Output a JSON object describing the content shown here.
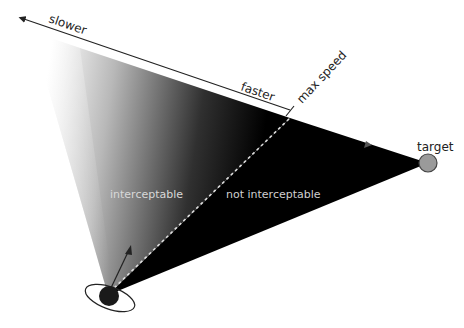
{
  "diagram": {
    "labels": {
      "slower": "slower",
      "faster": "faster",
      "max_speed": "max speed",
      "target": "target",
      "interceptable": "interceptable",
      "not_interceptable": "not interceptable"
    },
    "colors": {
      "background": "#ffffff",
      "fan_dark": "#000000",
      "fan_light": "#ffffff",
      "agent": "#1a1a1a",
      "target": "#9a9a9a",
      "speed_axis": "#222222",
      "dashed_line": "#dddddd",
      "region_text": "#cccccc"
    },
    "nodes": [
      {
        "id": "agent",
        "shape": "circle-with-orbit-ellipse"
      },
      {
        "id": "target",
        "shape": "circle",
        "label": "target"
      }
    ],
    "edges": [
      {
        "from": "agent",
        "to": "max-speed-point",
        "style": "dashed"
      },
      {
        "from": "agent",
        "to": "target",
        "style": "fill-boundary"
      }
    ]
  }
}
